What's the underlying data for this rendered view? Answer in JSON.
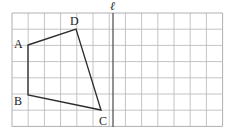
{
  "figure": {
    "type": "geometry-grid-figure",
    "colors": {
      "background": "#ffffff",
      "grid_line": "#b9b9bd",
      "grid_border": "#b0b0b4",
      "shape_stroke": "#2d2d2d",
      "mirror_line": "#55555c",
      "label_text": "#1a1a1a"
    },
    "grid": {
      "x0": 12,
      "y0": 13,
      "cell": 16.2,
      "cols": 13,
      "rows": 7
    },
    "mirror_line": {
      "label": "ℓ",
      "name": "line-l",
      "x_px": 113,
      "y_top_px": 13,
      "y_bottom_px": 127,
      "label_x_px": 110,
      "label_y_px": 0
    },
    "polygon": {
      "name": "quadrilateral-ABCD",
      "closed": true,
      "points_px": "28,45 76,29 101,110 28,95",
      "vertices": [
        {
          "id": "A",
          "x_px": 28,
          "y_px": 45,
          "label_x_px": 14,
          "label_y_px": 38
        },
        {
          "id": "D",
          "x_px": 76,
          "y_px": 29,
          "label_x_px": 70,
          "label_y_px": 15
        },
        {
          "id": "C",
          "x_px": 101,
          "y_px": 110,
          "label_x_px": 99,
          "label_y_px": 115
        },
        {
          "id": "B",
          "x_px": 28,
          "y_px": 95,
          "label_x_px": 14,
          "label_y_px": 95
        }
      ]
    }
  }
}
